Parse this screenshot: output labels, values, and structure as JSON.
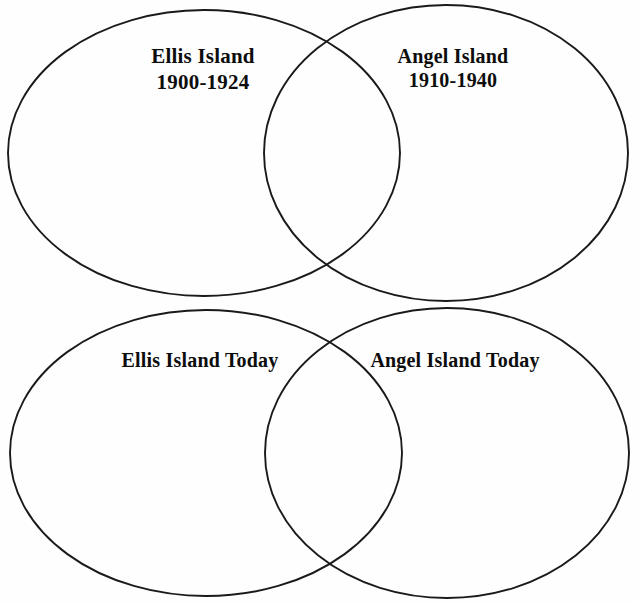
{
  "page": {
    "background_color": "#fefefe",
    "ink_color": "#1a1a1a",
    "width": 638,
    "height": 603
  },
  "diagrams": [
    {
      "id": "top-venn",
      "name": "historical-immigration-stations",
      "left_set": {
        "name": "ellis-island-historical",
        "line1": "Ellis Island",
        "line2": "1900-1924",
        "geometry": {
          "cx": 204,
          "cy": 153,
          "rx": 196,
          "ry": 143
        }
      },
      "right_set": {
        "name": "angel-island-historical",
        "line1": "Angel Island",
        "line2": "1910-1940",
        "geometry": {
          "cx": 446,
          "cy": 153,
          "rx": 182,
          "ry": 148
        }
      }
    },
    {
      "id": "bottom-venn",
      "name": "present-day-immigration-stations",
      "left_set": {
        "name": "ellis-island-today",
        "line1": "Ellis Island Today",
        "line2": "",
        "geometry": {
          "cx": 206,
          "cy": 453,
          "rx": 196,
          "ry": 143
        }
      },
      "right_set": {
        "name": "angel-island-today",
        "line1": "Angel Island Today",
        "line2": "",
        "geometry": {
          "cx": 447,
          "cy": 453,
          "rx": 182,
          "ry": 145
        }
      }
    }
  ]
}
